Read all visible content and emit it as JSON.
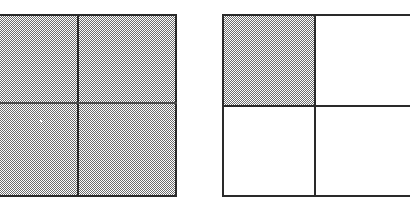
{
  "figure": {
    "background_color": "#ffffff",
    "line_color": "#2a2a2a",
    "shade_color": "#6e6e6e",
    "shade_pattern": "50-percent-checkerboard-dither",
    "canvas": {
      "width": 404,
      "height": 202
    }
  },
  "panels": [
    {
      "id": "left-square",
      "label": "Left square",
      "clipped_edge": "left",
      "bounds": {
        "x": -16,
        "y": 14,
        "width": 193,
        "height": 183
      },
      "divider_x": 78,
      "divider_y": 103,
      "grid": {
        "rows": 2,
        "cols": 2
      },
      "shaded_fraction": "4/4",
      "quadrants": [
        {
          "id": "top-left",
          "label": "Top left",
          "shaded": true
        },
        {
          "id": "top-right",
          "label": "Top right",
          "shaded": true
        },
        {
          "id": "bottom-left",
          "label": "Bottom left",
          "shaded": true
        },
        {
          "id": "bottom-right",
          "label": "Bottom right",
          "shaded": true
        }
      ]
    },
    {
      "id": "right-square",
      "label": "Right square",
      "clipped_edge": "right",
      "bounds": {
        "x": 222,
        "y": 14,
        "width": 188,
        "height": 183
      },
      "divider_x": 315,
      "divider_y": 106,
      "grid": {
        "rows": 2,
        "cols": 2
      },
      "shaded_fraction": "1/4",
      "quadrants": [
        {
          "id": "top-left",
          "label": "Top left",
          "shaded": true
        },
        {
          "id": "top-right",
          "label": "Top right",
          "shaded": false
        },
        {
          "id": "bottom-left",
          "label": "Bottom left",
          "shaded": false
        },
        {
          "id": "bottom-right",
          "label": "Bottom right",
          "shaded": false
        }
      ]
    }
  ],
  "artifacts": [
    {
      "id": "speck",
      "label": "White speck",
      "x": 40,
      "y": 120
    }
  ]
}
